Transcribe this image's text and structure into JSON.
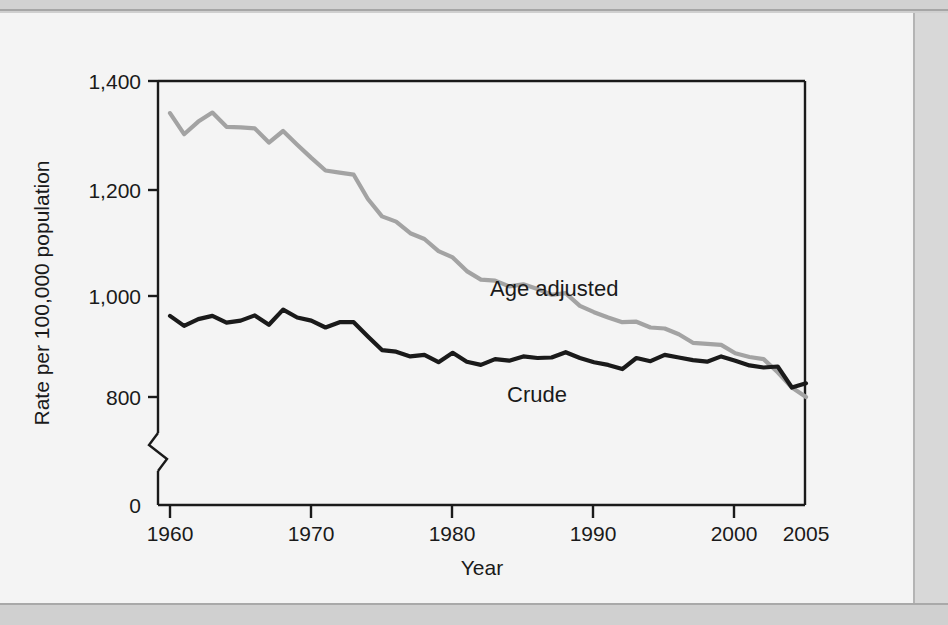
{
  "figure": {
    "ylabel": "Rate per 100,000 population",
    "xlabel": "Year",
    "series_label_age_adjusted": "Age adjusted",
    "series_label_crude": "Crude",
    "ytick_1400": "1,400",
    "ytick_1200": "1,200",
    "ytick_1000": "1,000",
    "ytick_800": "800",
    "ytick_0": "0",
    "xtick_1960": "1960",
    "xtick_1970": "1970",
    "xtick_1980": "1980",
    "xtick_1990": "1990",
    "xtick_2000": "2000",
    "xtick_2005": "2005"
  },
  "colors": {
    "age_adjusted_line": "#a3a3a3",
    "crude_line": "#1a1a1a",
    "axis": "#1a1a1a",
    "panel_background": "#f4f4f4",
    "page_background": "#cfcfcf"
  },
  "chart_data": {
    "type": "line",
    "title": "",
    "xlabel": "Year",
    "ylabel": "Rate per 100,000 population",
    "xlim": [
      1960,
      2005
    ],
    "ylim": [
      760,
      1400
    ],
    "ytick_values": [
      0,
      800,
      1000,
      1200,
      1400
    ],
    "ytick_labels": [
      "0",
      "800",
      "1,000",
      "1,200",
      "1,400"
    ],
    "xtick_values": [
      1960,
      1970,
      1980,
      1990,
      2000,
      2005
    ],
    "xtick_labels": [
      "1960",
      "1970",
      "1980",
      "1990",
      "2000",
      "2005"
    ],
    "axis_break": true,
    "axis_break_between": [
      760,
      0
    ],
    "grid": false,
    "legend": "inline-annotations",
    "x": [
      1960,
      1961,
      1962,
      1963,
      1964,
      1965,
      1966,
      1967,
      1968,
      1969,
      1970,
      1971,
      1972,
      1973,
      1974,
      1975,
      1976,
      1977,
      1978,
      1979,
      1980,
      1981,
      1982,
      1983,
      1984,
      1985,
      1986,
      1987,
      1988,
      1989,
      1990,
      1991,
      1992,
      1993,
      1994,
      1995,
      1996,
      1997,
      1998,
      1999,
      2000,
      2001,
      2002,
      2003,
      2004,
      2005
    ],
    "series": [
      {
        "name": "Age adjusted",
        "color": "#a3a3a3",
        "values": [
          1339,
          1299,
          1323,
          1340,
          1313,
          1312,
          1310,
          1283,
          1305,
          1279,
          1254,
          1230,
          1226,
          1222,
          1176,
          1143,
          1133,
          1111,
          1100,
          1077,
          1065,
          1039,
          1023,
          1021,
          1010,
          1014,
          1005,
          994,
          997,
          973,
          961,
          951,
          942,
          943,
          932,
          930,
          919,
          903,
          901,
          899,
          883,
          876,
          872,
          847,
          818,
          800
        ]
      },
      {
        "name": "Crude",
        "color": "#1a1a1a",
        "values": [
          954,
          935,
          948,
          954,
          941,
          945,
          955,
          937,
          966,
          951,
          945,
          932,
          942,
          942,
          915,
          889,
          886,
          877,
          880,
          866,
          884,
          867,
          861,
          872,
          869,
          877,
          874,
          875,
          885,
          874,
          866,
          861,
          853,
          874,
          868,
          880,
          875,
          870,
          867,
          877,
          869,
          860,
          856,
          858,
          818,
          826
        ]
      }
    ]
  }
}
